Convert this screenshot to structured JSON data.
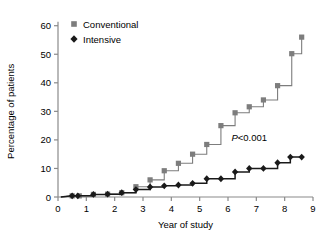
{
  "chart_data": {
    "type": "line",
    "subtype": "step",
    "title": "",
    "xlabel": "Year of study",
    "ylabel": "Percentage of patients",
    "xlim": [
      0,
      9
    ],
    "ylim": [
      0,
      62
    ],
    "xticks": [
      0,
      1,
      2,
      3,
      4,
      5,
      6,
      7,
      8,
      9
    ],
    "yticks": [
      0,
      10,
      20,
      30,
      40,
      50,
      60
    ],
    "xtick_labels": [
      "0",
      "1",
      "2",
      "3",
      "4",
      "5",
      "6",
      "7",
      "8",
      "9"
    ],
    "ytick_labels": [
      "0",
      "10",
      "20",
      "30",
      "40",
      "50",
      "60"
    ],
    "grid": false,
    "legend_position": "top-left",
    "annotations": [
      {
        "text_italic": "P",
        "text": "<0.001",
        "x": 6.75,
        "y": 19.5
      }
    ],
    "series": [
      {
        "name": "Conventional",
        "color": "#7d7d7d",
        "marker": "square",
        "x": [
          0.5,
          0.75,
          1.25,
          1.75,
          2.25,
          2.75,
          3.25,
          3.75,
          4.25,
          4.75,
          5.25,
          5.75,
          6.25,
          6.75,
          7.25,
          7.75,
          8.25,
          8.6
        ],
        "values": [
          0.4,
          0.4,
          0.9,
          1.0,
          1.5,
          3.6,
          6.0,
          9.2,
          11.8,
          15.0,
          18.4,
          25.0,
          29.5,
          31.6,
          34.0,
          39.0,
          50.2,
          56.0
        ]
      },
      {
        "name": "Intensive",
        "color": "#1a1a1a",
        "marker": "diamond",
        "x": [
          0.5,
          0.7,
          1.25,
          1.75,
          2.25,
          2.75,
          3.25,
          3.75,
          4.25,
          4.75,
          5.25,
          5.75,
          6.25,
          6.75,
          7.25,
          7.75,
          8.2,
          8.6
        ],
        "values": [
          0.4,
          0.4,
          0.9,
          1.0,
          1.5,
          2.6,
          3.5,
          3.9,
          4.2,
          4.8,
          6.4,
          6.4,
          8.8,
          10.0,
          10.0,
          12.0,
          14.0,
          14.0
        ]
      }
    ]
  },
  "legend": {
    "items": [
      {
        "label": "Conventional",
        "marker": "square",
        "color": "#7d7d7d"
      },
      {
        "label": "Intensive",
        "marker": "diamond",
        "color": "#1a1a1a"
      }
    ]
  }
}
